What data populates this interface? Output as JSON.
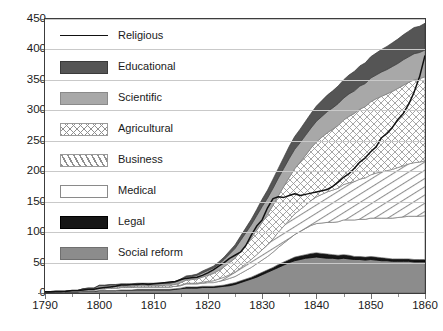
{
  "chart_data": {
    "type": "area",
    "title": "",
    "subtitle": "",
    "xlabel": "",
    "ylabel": "",
    "xlim": [
      1790,
      1860
    ],
    "ylim": [
      0,
      450
    ],
    "grid": true,
    "legend_position": "inside-top-left",
    "stacked": true,
    "note": "Black 'Religious' line marks the running total (top of the stack); the seven filled bands below it are the stacked component series.",
    "x": [
      1790,
      1791,
      1792,
      1793,
      1794,
      1795,
      1796,
      1797,
      1798,
      1799,
      1800,
      1801,
      1802,
      1803,
      1804,
      1805,
      1806,
      1807,
      1808,
      1809,
      1810,
      1811,
      1812,
      1813,
      1814,
      1815,
      1816,
      1817,
      1818,
      1819,
      1820,
      1821,
      1822,
      1823,
      1824,
      1825,
      1826,
      1827,
      1828,
      1829,
      1830,
      1831,
      1832,
      1833,
      1834,
      1835,
      1836,
      1837,
      1838,
      1839,
      1840,
      1841,
      1842,
      1843,
      1844,
      1845,
      1846,
      1847,
      1848,
      1849,
      1850,
      1851,
      1852,
      1853,
      1854,
      1855,
      1856,
      1857,
      1858,
      1859,
      1860
    ],
    "xticks": [
      1790,
      1800,
      1810,
      1820,
      1830,
      1840,
      1850,
      1860
    ],
    "yticks": [
      0,
      50,
      100,
      150,
      200,
      250,
      300,
      350,
      400,
      450
    ],
    "series": [
      {
        "name": "Social reform",
        "swatch": "social",
        "values": [
          1,
          1,
          1,
          1,
          2,
          2,
          2,
          3,
          3,
          3,
          4,
          4,
          4,
          4,
          5,
          5,
          5,
          5,
          5,
          5,
          5,
          5,
          5,
          5,
          6,
          7,
          8,
          8,
          8,
          9,
          9,
          9,
          10,
          11,
          12,
          14,
          17,
          20,
          23,
          26,
          30,
          34,
          38,
          42,
          46,
          50,
          53,
          55,
          57,
          58,
          59,
          58,
          57,
          57,
          56,
          57,
          56,
          55,
          55,
          54,
          55,
          54,
          53,
          53,
          52,
          52,
          52,
          52,
          51,
          51,
          51
        ]
      },
      {
        "name": "Legal",
        "swatch": "legal",
        "values": [
          0,
          0,
          0,
          0,
          0,
          0,
          0,
          0,
          0,
          0,
          0,
          0,
          0,
          0,
          0,
          0,
          0,
          1,
          1,
          1,
          1,
          1,
          1,
          1,
          1,
          1,
          2,
          2,
          2,
          2,
          2,
          2,
          2,
          2,
          3,
          3,
          3,
          3,
          3,
          4,
          4,
          4,
          4,
          5,
          5,
          5,
          6,
          6,
          6,
          7,
          7,
          7,
          7,
          6,
          6,
          6,
          6,
          5,
          5,
          5,
          5,
          5,
          5,
          4,
          4,
          4,
          4,
          4,
          4,
          4,
          4
        ]
      },
      {
        "name": "Medical",
        "swatch": "medical",
        "values": [
          0,
          0,
          0,
          0,
          1,
          1,
          1,
          2,
          2,
          2,
          3,
          3,
          4,
          4,
          4,
          4,
          4,
          4,
          4,
          4,
          4,
          4,
          4,
          4,
          4,
          4,
          5,
          5,
          5,
          5,
          6,
          6,
          7,
          8,
          9,
          10,
          12,
          14,
          16,
          18,
          20,
          22,
          25,
          28,
          31,
          34,
          37,
          40,
          43,
          46,
          48,
          50,
          52,
          53,
          55,
          57,
          58,
          60,
          61,
          62,
          63,
          64,
          65,
          66,
          67,
          68,
          69,
          70,
          71,
          71,
          72
        ]
      },
      {
        "name": "Business",
        "swatch": "business",
        "values": [
          0,
          0,
          0,
          0,
          0,
          0,
          0,
          0,
          0,
          0,
          0,
          0,
          0,
          0,
          0,
          0,
          0,
          0,
          0,
          0,
          0,
          0,
          0,
          0,
          0,
          1,
          1,
          1,
          1,
          2,
          2,
          3,
          4,
          5,
          6,
          7,
          9,
          11,
          13,
          15,
          17,
          19,
          22,
          25,
          28,
          31,
          34,
          36,
          38,
          41,
          44,
          47,
          50,
          53,
          55,
          58,
          61,
          63,
          66,
          68,
          71,
          74,
          76,
          78,
          80,
          82,
          84,
          86,
          88,
          89,
          90
        ]
      },
      {
        "name": "Agricultural",
        "swatch": "agricultural",
        "values": [
          0,
          0,
          0,
          0,
          0,
          0,
          0,
          1,
          1,
          1,
          2,
          2,
          2,
          2,
          2,
          2,
          2,
          2,
          2,
          2,
          2,
          2,
          3,
          3,
          3,
          4,
          5,
          6,
          7,
          8,
          10,
          12,
          14,
          17,
          20,
          23,
          27,
          31,
          35,
          40,
          45,
          50,
          55,
          60,
          65,
          70,
          74,
          78,
          82,
          86,
          90,
          94,
          97,
          100,
          103,
          106,
          109,
          112,
          115,
          117,
          120,
          122,
          124,
          126,
          128,
          130,
          132,
          134,
          136,
          137,
          138
        ]
      },
      {
        "name": "Scientific",
        "swatch": "scientific",
        "values": [
          0,
          0,
          0,
          0,
          0,
          1,
          1,
          1,
          2,
          2,
          3,
          3,
          3,
          3,
          3,
          3,
          3,
          3,
          3,
          3,
          3,
          3,
          3,
          3,
          4,
          4,
          5,
          5,
          6,
          7,
          8,
          9,
          10,
          12,
          14,
          16,
          18,
          20,
          22,
          24,
          26,
          27,
          28,
          29,
          30,
          31,
          32,
          32,
          33,
          33,
          34,
          34,
          35,
          35,
          36,
          36,
          37,
          37,
          38,
          38,
          39,
          39,
          40,
          40,
          41,
          41,
          42,
          42,
          43,
          43,
          44
        ]
      },
      {
        "name": "Educational",
        "swatch": "educational",
        "values": [
          0,
          0,
          0,
          0,
          0,
          0,
          0,
          0,
          0,
          0,
          1,
          1,
          1,
          1,
          1,
          1,
          1,
          1,
          1,
          1,
          1,
          1,
          1,
          1,
          1,
          2,
          2,
          2,
          2,
          3,
          3,
          3,
          4,
          4,
          5,
          6,
          7,
          8,
          9,
          10,
          12,
          13,
          15,
          16,
          18,
          20,
          21,
          22,
          23,
          24,
          25,
          26,
          27,
          28,
          29,
          30,
          31,
          32,
          33,
          34,
          35,
          36,
          37,
          38,
          39,
          40,
          41,
          42,
          43,
          43,
          44
        ]
      }
    ],
    "religious_line": {
      "name": "Religious",
      "description": "Total / upper boundary line",
      "values": [
        2,
        2,
        3,
        3,
        3,
        4,
        4,
        5,
        6,
        6,
        8,
        9,
        10,
        11,
        13,
        13,
        14,
        14,
        15,
        14,
        15,
        16,
        17,
        18,
        19,
        22,
        24,
        25,
        26,
        29,
        33,
        38,
        44,
        50,
        57,
        62,
        67,
        78,
        95,
        110,
        120,
        140,
        155,
        158,
        157,
        160,
        163,
        160,
        162,
        164,
        166,
        168,
        170,
        175,
        182,
        190,
        196,
        205,
        215,
        222,
        232,
        240,
        255,
        262,
        272,
        285,
        295,
        310,
        330,
        355,
        390
      ]
    },
    "legend": [
      {
        "label": "Religious",
        "swatch": "line"
      },
      {
        "label": "Educational",
        "swatch": "educational"
      },
      {
        "label": "Scientific",
        "swatch": "scientific"
      },
      {
        "label": "Agricultural",
        "swatch": "agricultural"
      },
      {
        "label": "Business",
        "swatch": "business"
      },
      {
        "label": "Medical",
        "swatch": "medical"
      },
      {
        "label": "Legal",
        "swatch": "legal"
      },
      {
        "label": "Social reform",
        "swatch": "social"
      }
    ],
    "colors": {
      "educational": "#555555",
      "scientific": "#a8a8a8",
      "agricultural": "#ffffff",
      "business": "#ffffff",
      "medical": "#ffffff",
      "legal": "#161616",
      "social": "#8c8c8c",
      "line": "#111111",
      "grid": "#c9c9c9",
      "frame": "#3c3c3c",
      "text": "#1a1a1a"
    }
  }
}
